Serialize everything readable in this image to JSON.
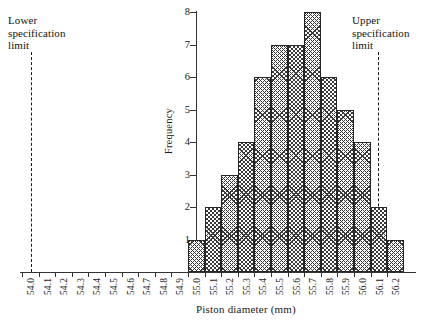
{
  "annotations": {
    "lower_spec_label": "Lower\nspecification\nlimit",
    "upper_spec_label": "Upper\nspecification\nlimit"
  },
  "chart_data": {
    "type": "bar",
    "title": "",
    "xlabel": "Piston diameter (mm)",
    "ylabel": "Frequency",
    "categories": [
      "54.0",
      "54.1",
      "54.2",
      "54.3",
      "54.4",
      "54.5",
      "54.6",
      "54.7",
      "54.8",
      "54.9",
      "55.0",
      "55.1",
      "55.2",
      "55.3",
      "55.4",
      "55.5",
      "55.6",
      "55.7",
      "55.8",
      "55.9",
      "56.0",
      "56.1",
      "56.2"
    ],
    "values": [
      0,
      0,
      0,
      0,
      0,
      0,
      0,
      0,
      0,
      0,
      1,
      2,
      3,
      4,
      6,
      7,
      7,
      8,
      6,
      5,
      4,
      2,
      1
    ],
    "bars": [
      {
        "category": "55.0",
        "value": 1
      },
      {
        "category": "55.1",
        "value": 2
      },
      {
        "category": "55.2",
        "value": 3
      },
      {
        "category": "55.3",
        "value": 4
      },
      {
        "category": "55.4",
        "value": 6
      },
      {
        "category": "55.5",
        "value": 7
      },
      {
        "category": "55.6",
        "value": 7
      },
      {
        "category": "55.7",
        "value": 8
      },
      {
        "category": "55.8",
        "value": 6
      },
      {
        "category": "55.9",
        "value": 5
      },
      {
        "category": "56.0",
        "value": 4
      },
      {
        "category": "56.1",
        "value": 2
      },
      {
        "category": "56.2",
        "value": 1
      }
    ],
    "yticks": [
      1,
      2,
      3,
      4,
      5,
      6,
      7,
      8
    ],
    "ylim": [
      0,
      8
    ],
    "grid": false,
    "legend": null,
    "annotations": [
      {
        "name": "lower-specification-limit",
        "text": "Lower specification limit",
        "x": "54.0",
        "style": "dashed-vertical-line"
      },
      {
        "name": "upper-specification-limit",
        "text": "Upper specification limit",
        "x": "56.1",
        "style": "dashed-vertical-line"
      }
    ],
    "colors": {
      "bar_outline": "#262626",
      "bar_hatch": "#3a3a3a",
      "axis": "#333333",
      "text": "#1a1a1a"
    }
  }
}
